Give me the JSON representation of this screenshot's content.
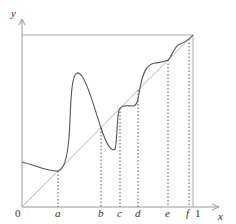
{
  "diagram": {
    "type": "function-plot-fixed-points",
    "axes": {
      "x_label": "x",
      "y_label": "y",
      "origin_label": "0",
      "x_end_label": "1"
    },
    "x_tick_labels": [
      "a",
      "b",
      "c",
      "d",
      "e",
      "f"
    ],
    "elements": {
      "identity_line": "y = x diagonal from (0,0) to (1,1)",
      "unit_box_top": "horizontal line y = 1",
      "unit_box_right": "vertical line x = 1",
      "curve": "continuous function f(x) crossing diagonal at fixed points",
      "dotted_guides": "vertical dotted lines from curve/diagonal intersections down to x-axis at a, b, c, d, e, f"
    },
    "colors": {
      "axis": "#999999",
      "diagonal": "#b0b0b0",
      "curve": "#555555",
      "dotted": "#555555",
      "text": "#333333"
    }
  }
}
